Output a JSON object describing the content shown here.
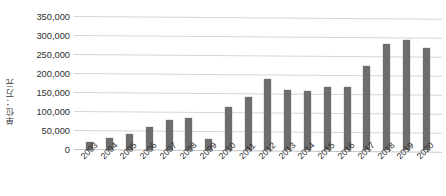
{
  "chart_data": {
    "type": "bar",
    "title": "",
    "xlabel": "",
    "ylabel": "单位：万元",
    "categories": [
      "2003",
      "2004",
      "2005",
      "2006",
      "2007",
      "2008",
      "2009",
      "2010",
      "2011",
      "2012",
      "2013",
      "2014",
      "2015",
      "2016",
      "2017",
      "2018",
      "2019",
      "2020"
    ],
    "values": [
      22000,
      32000,
      43000,
      60000,
      78000,
      85000,
      30000,
      113000,
      140000,
      186000,
      157000,
      155000,
      165000,
      165000,
      220000,
      280000,
      290000,
      268000
    ],
    "series": [
      {
        "name": "",
        "values": [
          22000,
          32000,
          43000,
          60000,
          78000,
          85000,
          30000,
          113000,
          140000,
          186000,
          157000,
          155000,
          165000,
          165000,
          220000,
          280000,
          290000,
          268000
        ]
      }
    ],
    "ylim": [
      0,
      350000
    ],
    "ytick_values": [
      0,
      50000,
      100000,
      150000,
      200000,
      250000,
      300000,
      350000
    ],
    "ytick_labels": [
      "0",
      "50,000",
      "100,000",
      "150,000",
      "200,000",
      "250,000",
      "300,000",
      "350,000"
    ],
    "grid": true,
    "grid_axis": "y",
    "legend": false,
    "legend_position": "none",
    "bar_color": "#6d6d6d",
    "gridline_color": "#d6d6d6",
    "background_color": "#ffffff",
    "xtick_rotation": -45
  }
}
